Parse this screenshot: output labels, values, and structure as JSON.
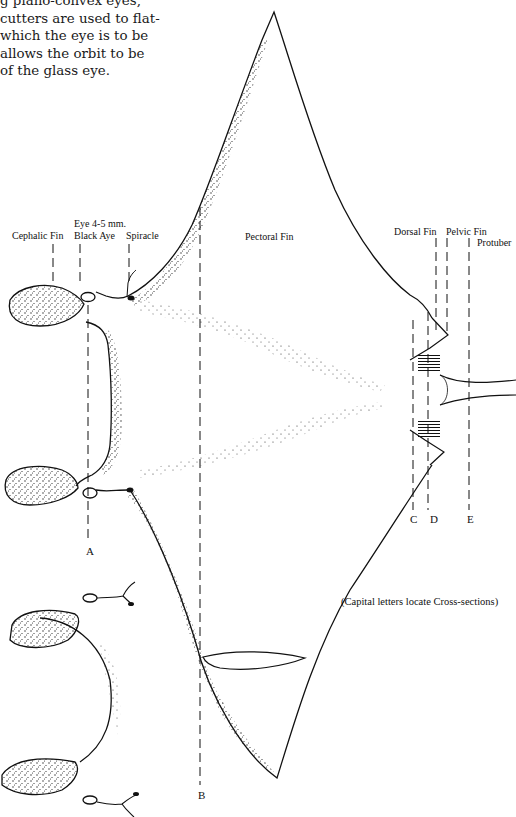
{
  "intro_text": {
    "lines": [
      "g plano-convex eyes,",
      "cutters are used to flat-",
      "which the eye is to be",
      "allows the orbit to be",
      "of the glass eye."
    ]
  },
  "diagram": {
    "part_labels": {
      "cephalic_fin": "Cephalic Fin",
      "eye_line1": "Eye 4-5 mm.",
      "eye_line2": "Black Aye",
      "spiracle": "Spiracle",
      "pectoral_fin": "Pectoral Fin",
      "dorsal_fin": "Dorsal Fin",
      "pelvic_fin": "Pelvic Fin",
      "protuberance": "Protuber"
    },
    "section_letters": {
      "a": "A",
      "b": "B",
      "c": "C",
      "d": "D",
      "e": "E"
    },
    "note": "(Capital letters locate Cross-sections)"
  }
}
